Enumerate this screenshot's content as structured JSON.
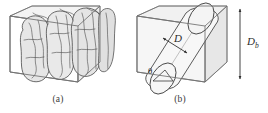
{
  "figure": {
    "name": "porous-media-representation-figure",
    "panels": [
      {
        "id": "a",
        "caption": "(a)",
        "description": "transparent rectangular box containing irregular lobed blob shapes"
      },
      {
        "id": "b",
        "caption": "(b)",
        "description": "transparent rectangular box containing an inclined circular cylinder"
      }
    ],
    "labels": {
      "diameter": "D",
      "angle": "θ",
      "box_height_main": "D",
      "box_height_sub": "b"
    },
    "colors": {
      "background": "#ffffff",
      "outline": "#4a4a4a",
      "outline_light": "#9a9a9a",
      "fill_light": "#eeeeee",
      "fill_mid": "#e2e2e2",
      "fill_shade": "#d8d8d8",
      "blob_stroke": "#3d3d3d",
      "text": "#2b2b2b",
      "caption_text": "#3a3a3a"
    }
  }
}
